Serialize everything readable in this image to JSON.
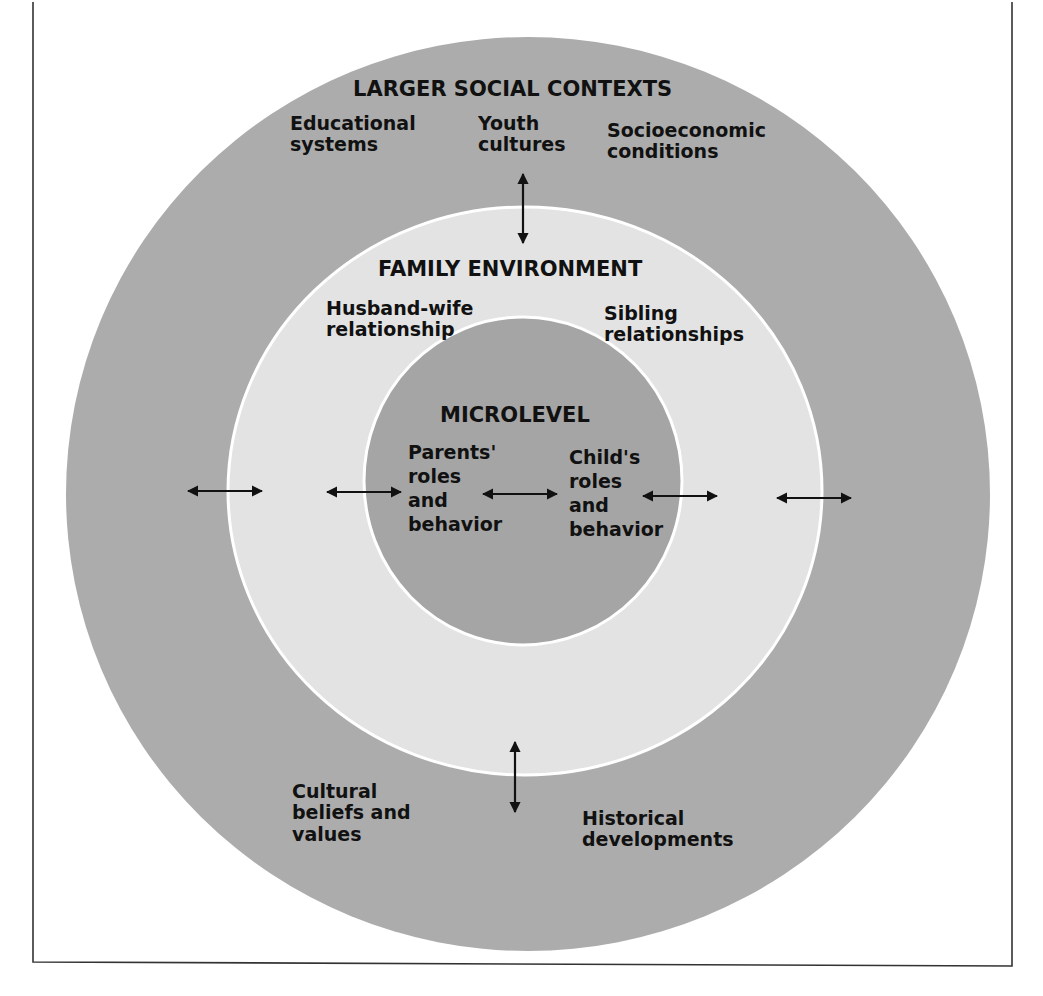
{
  "colors": {
    "background": "#ffffff",
    "frame_border": "#333333",
    "outer_ring": "#acacac",
    "middle_ring": "#e3e3e3",
    "inner_circle": "#a5a5a5",
    "ring_separator": "#ffffff",
    "text": "#111111",
    "arrow": "#111111"
  },
  "diagram": {
    "type": "concentric-circles",
    "levels": [
      {
        "id": "larger-social-contexts",
        "title": "LARGER SOCIAL CONTEXTS",
        "items": [
          "Educational\nsystems",
          "Youth\ncultures",
          "Socioeconomic\nconditions",
          "Cultural\nbeliefs and\nvalues",
          "Historical\ndevelopments"
        ]
      },
      {
        "id": "family-environment",
        "title": "FAMILY ENVIRONMENT",
        "items": [
          "Husband-wife\nrelationship",
          "Sibling\nrelationships"
        ]
      },
      {
        "id": "microlevel",
        "title": "MICROLEVEL",
        "items": [
          "Parents'\nroles\nand\nbehavior",
          "Child's\nroles\nand\nbehavior"
        ]
      }
    ],
    "arrows": [
      {
        "id": "top-vertical",
        "direction": "bidirectional-vertical",
        "between": [
          "larger-social-contexts",
          "family-environment"
        ]
      },
      {
        "id": "bottom-vertical",
        "direction": "bidirectional-vertical",
        "between": [
          "family-environment",
          "larger-social-contexts"
        ]
      },
      {
        "id": "far-left",
        "direction": "bidirectional-horizontal",
        "between": [
          "larger-social-contexts",
          "family-environment"
        ]
      },
      {
        "id": "mid-left",
        "direction": "bidirectional-horizontal",
        "between": [
          "family-environment",
          "microlevel"
        ]
      },
      {
        "id": "center",
        "direction": "bidirectional-horizontal",
        "between": [
          "parents",
          "child"
        ]
      },
      {
        "id": "mid-right",
        "direction": "bidirectional-horizontal",
        "between": [
          "microlevel",
          "family-environment"
        ]
      },
      {
        "id": "far-right",
        "direction": "bidirectional-horizontal",
        "between": [
          "family-environment",
          "larger-social-contexts"
        ]
      }
    ]
  }
}
